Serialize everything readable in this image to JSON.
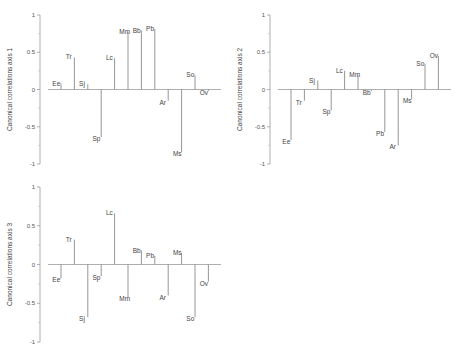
{
  "chart_data": [
    {
      "type": "bar",
      "title": "",
      "xlabel": "",
      "ylabel": "Canonical correlations axis 1",
      "ylim": [
        -1,
        1
      ],
      "yticks": [
        "1",
        "0.5",
        "0",
        "-0.5",
        "-1"
      ],
      "grid": false,
      "categories": [
        "Ee",
        "Tr",
        "Sj",
        "Sp",
        "Lc",
        "Mm",
        "Bb",
        "Pb",
        "Ar",
        "Ms",
        "So",
        "Ov"
      ],
      "values": [
        0.08,
        0.43,
        0.07,
        -0.64,
        0.42,
        0.77,
        0.79,
        0.81,
        -0.15,
        -0.84,
        0.19,
        -0.02
      ]
    },
    {
      "type": "bar",
      "title": "",
      "xlabel": "",
      "ylabel": "Canonical correlations axis 2",
      "ylim": [
        -1,
        1
      ],
      "yticks": [
        "1",
        "0.5",
        "0",
        "-0.5",
        "-1"
      ],
      "grid": false,
      "categories": [
        "Ee",
        "Tr",
        "Sj",
        "Sp",
        "Lc",
        "Mm",
        "Bb",
        "Pb",
        "Ar",
        "Ms",
        "So",
        "Ov"
      ],
      "values": [
        -0.68,
        -0.15,
        0.12,
        -0.28,
        0.25,
        0.19,
        -0.02,
        -0.57,
        -0.75,
        -0.13,
        0.34,
        0.45
      ]
    },
    {
      "type": "bar",
      "title": "",
      "xlabel": "",
      "ylabel": "Canonical correlations axis 3",
      "ylim": [
        -1,
        1
      ],
      "yticks": [
        "1",
        "0.5",
        "0",
        "-0.5",
        "-1"
      ],
      "grid": false,
      "categories": [
        "Ee",
        "Tr",
        "Sj",
        "Sp",
        "Lc",
        "Mm",
        "Bb",
        "Pb",
        "Ar",
        "Ms",
        "So",
        "Ov"
      ],
      "values": [
        -0.18,
        0.32,
        -0.68,
        -0.15,
        0.66,
        -0.42,
        0.18,
        0.11,
        -0.4,
        0.15,
        -0.68,
        -0.22
      ]
    }
  ],
  "panels": [
    {
      "id": "axis1",
      "left": 0,
      "top": 0
    },
    {
      "id": "axis2",
      "left": 230,
      "top": 0
    },
    {
      "id": "axis3",
      "left": 0,
      "top": 175
    }
  ],
  "colors": {
    "bar": "#8a8a8a",
    "axis": "#9a9a9a",
    "text": "#444444"
  }
}
